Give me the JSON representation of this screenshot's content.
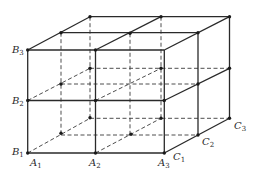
{
  "figure": {
    "labels": {
      "A1": {
        "letter": "A",
        "sub": "1"
      },
      "A2": {
        "letter": "A",
        "sub": "2"
      },
      "A3": {
        "letter": "A",
        "sub": "3"
      },
      "B1": {
        "letter": "B",
        "sub": "1"
      },
      "B2": {
        "letter": "B",
        "sub": "2"
      },
      "B3": {
        "letter": "B",
        "sub": "3"
      },
      "C1": {
        "letter": "C",
        "sub": "1"
      },
      "C2": {
        "letter": "C",
        "sub": "2"
      },
      "C3": {
        "letter": "C",
        "sub": "3"
      }
    },
    "colors": {
      "line": "#2a2a2a",
      "background": "#ffffff"
    }
  }
}
